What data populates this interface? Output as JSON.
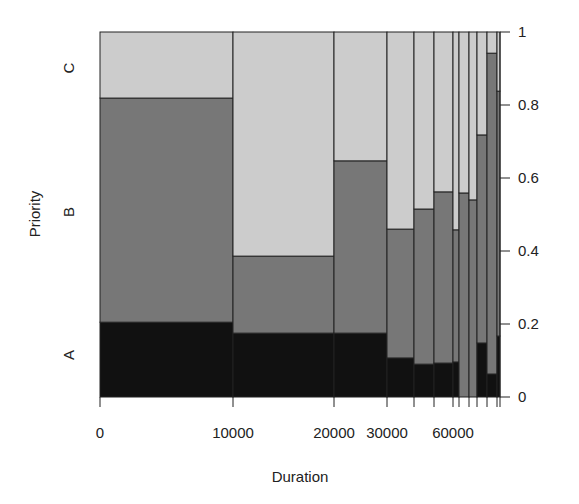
{
  "chart_data": {
    "type": "spineplot",
    "title": "",
    "xlabel": "Duration",
    "ylabel": "Priority",
    "categories_y": [
      "A",
      "B",
      "C"
    ],
    "colors": {
      "A": "#111111",
      "B": "#777777",
      "C": "#cccccc"
    },
    "x_tick_labels": [
      {
        "label": "0",
        "x": 100
      },
      {
        "label": "10000",
        "x": 233
      },
      {
        "label": "20000",
        "x": 334
      },
      {
        "label": "30000",
        "x": 387
      },
      {
        "label": "60000",
        "x": 453
      }
    ],
    "x_breaks_px": [
      100,
      233,
      334,
      387,
      414,
      434,
      453,
      459,
      469,
      477,
      487,
      497,
      500
    ],
    "y_right_ticks": [
      "0",
      "0.2",
      "0.4",
      "0.6",
      "0.8",
      "1"
    ],
    "ylim": [
      0,
      1
    ],
    "bars": [
      {
        "A": 0.205,
        "B": 0.614,
        "C": 0.181
      },
      {
        "A": 0.175,
        "B": 0.211,
        "C": 0.614
      },
      {
        "A": 0.175,
        "B": 0.472,
        "C": 0.353
      },
      {
        "A": 0.107,
        "B": 0.353,
        "C": 0.54
      },
      {
        "A": 0.09,
        "B": 0.425,
        "C": 0.485
      },
      {
        "A": 0.093,
        "B": 0.469,
        "C": 0.438
      },
      {
        "A": 0.096,
        "B": 0.362,
        "C": 0.542
      },
      {
        "A": 0.0,
        "B": 0.559,
        "C": 0.441
      },
      {
        "A": 0.0,
        "B": 0.54,
        "C": 0.46
      },
      {
        "A": 0.148,
        "B": 0.57,
        "C": 0.282
      },
      {
        "A": 0.063,
        "B": 0.879,
        "C": 0.058
      },
      {
        "A": 0.167,
        "B": 0.671,
        "C": 0.162
      }
    ],
    "left_axis_labels": [
      {
        "label": "A",
        "y": 355
      },
      {
        "label": "B",
        "y": 212
      },
      {
        "label": "C",
        "y": 68
      }
    ]
  }
}
